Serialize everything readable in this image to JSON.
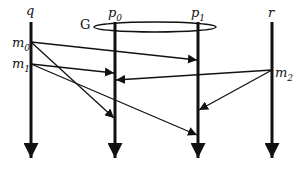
{
  "diagram": {
    "group_label": "G",
    "processes": [
      {
        "id": "q",
        "label": "q",
        "sub": ""
      },
      {
        "id": "p0",
        "label": "p",
        "sub": "0"
      },
      {
        "id": "p1",
        "label": "p",
        "sub": "1"
      },
      {
        "id": "r",
        "label": "r",
        "sub": ""
      }
    ],
    "messages": [
      {
        "id": "m0",
        "label": "m",
        "sub": "0",
        "from": "q",
        "to": [
          "p0",
          "p1"
        ]
      },
      {
        "id": "m1",
        "label": "m",
        "sub": "1",
        "from": "q",
        "to": [
          "p0",
          "p1"
        ]
      },
      {
        "id": "m2",
        "label": "m",
        "sub": "2",
        "from": "r",
        "to": [
          "p0",
          "p1"
        ]
      }
    ]
  }
}
